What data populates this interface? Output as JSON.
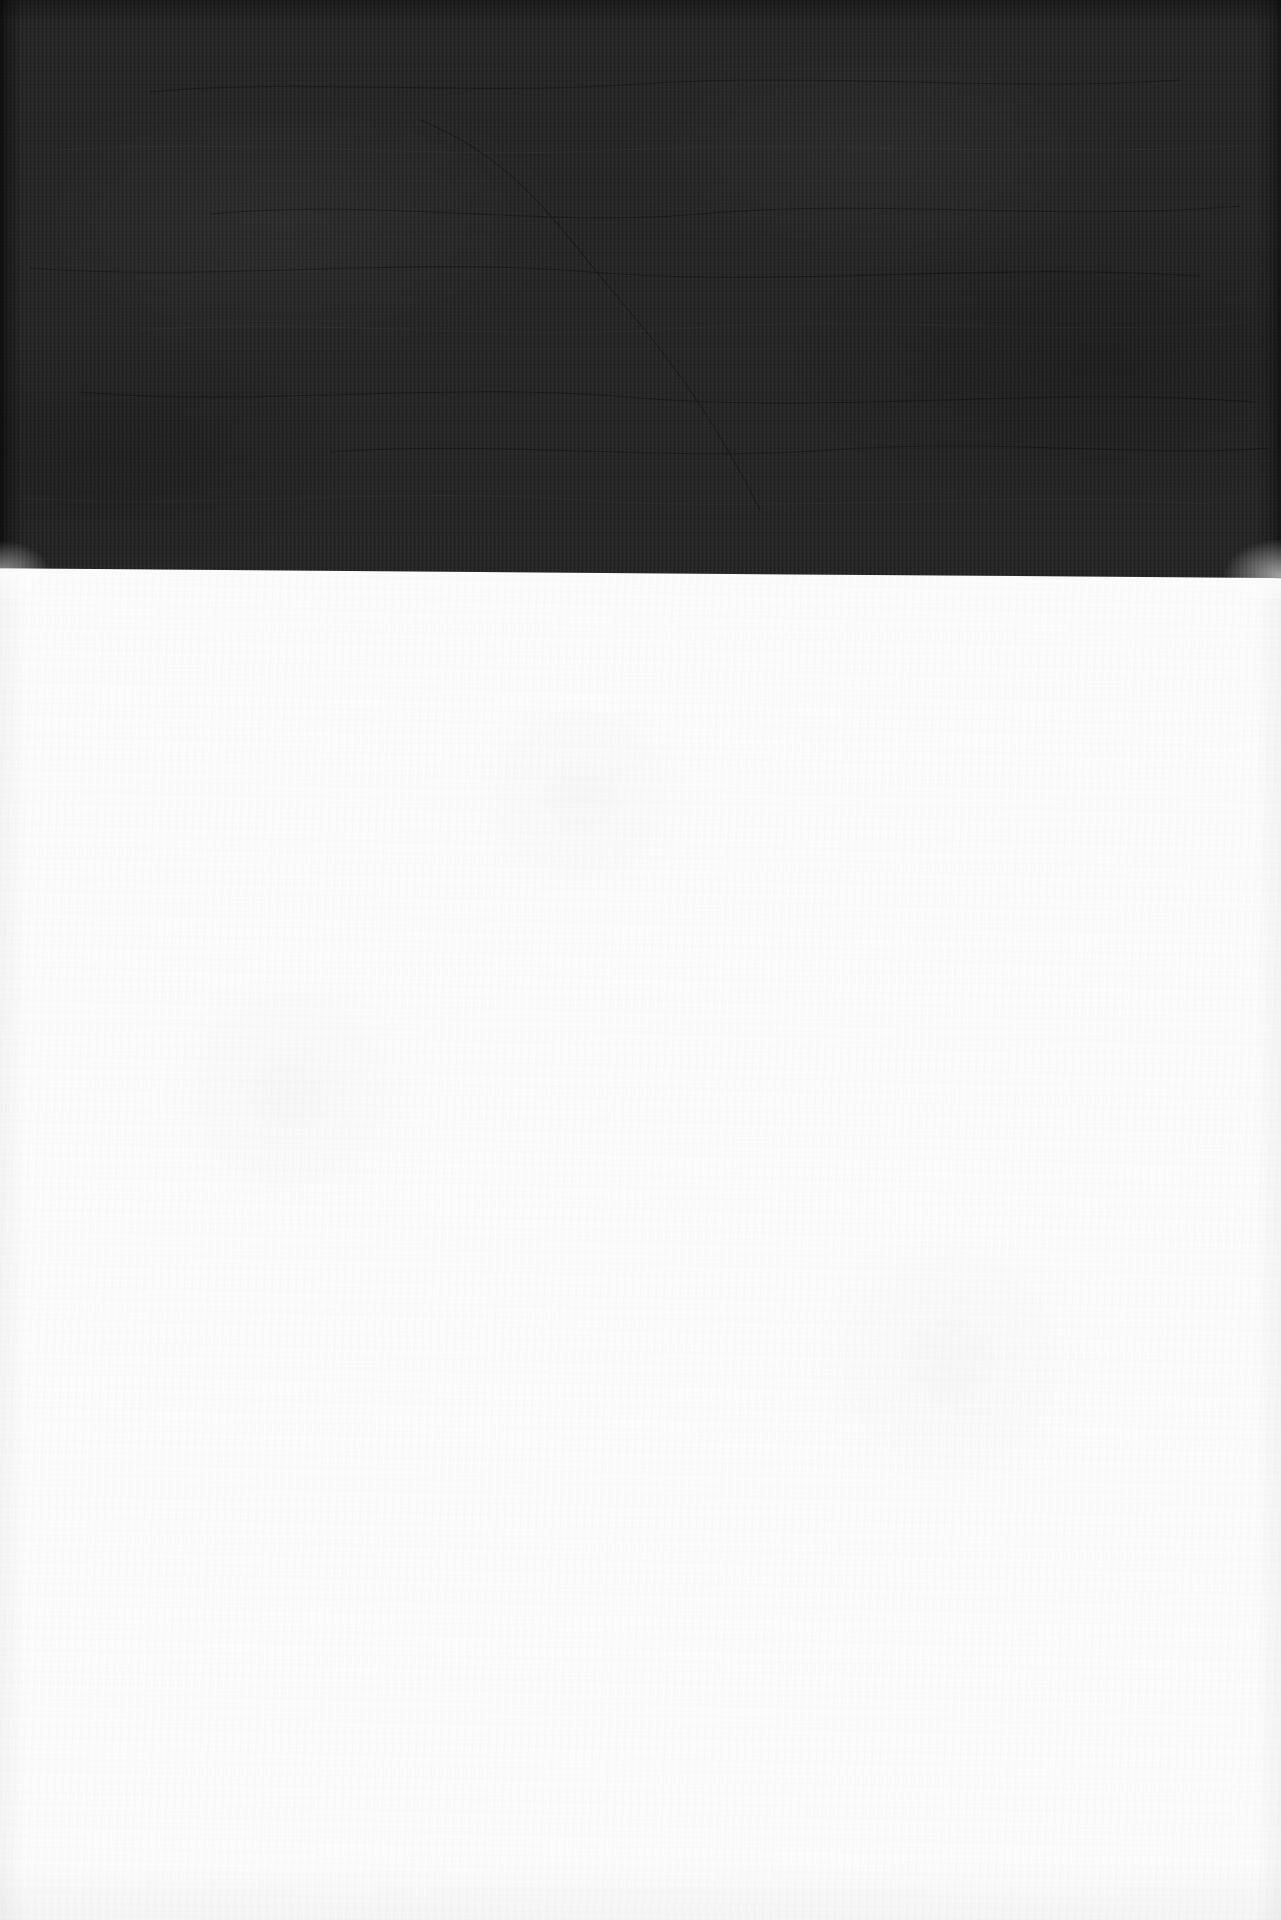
{
  "scene": {
    "width": 1281,
    "height": 1920,
    "description": "Photograph of a blank white sheet resting on a dark ribbed textile surface",
    "regions": [
      {
        "name": "dark-textile-band",
        "position": "top",
        "color": "#242424",
        "texture": "fine vertical ribbing with faint horizontal creases",
        "bottom_edge_y_left": 572,
        "bottom_edge_y_right": 582,
        "height_px": 584
      },
      {
        "name": "white-paper-field",
        "position": "bottom",
        "color": "#fdfdfd",
        "texture": "subtle paper grain, no printed content",
        "top_edge_y": 577,
        "height_px": 1343
      }
    ],
    "text_content": [],
    "foreground_objects": []
  },
  "colors": {
    "textile_dark": "#242424",
    "textile_shadow": "#101010",
    "paper_white": "#fdfdfd",
    "paper_shadow": "#f2f2f2"
  },
  "creases": {
    "count": 9,
    "note": "faint low-contrast wrinkle lines running roughly horizontally across the textile"
  }
}
